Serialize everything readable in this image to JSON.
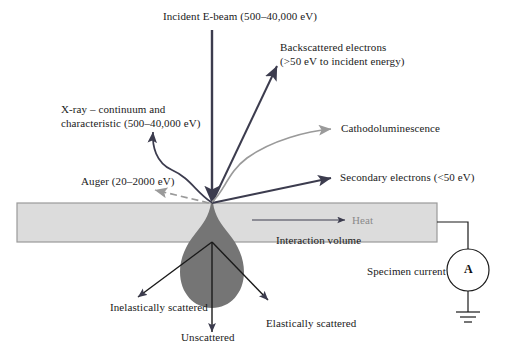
{
  "figure": {
    "title_semantics": "electron-beam specimen interaction diagram",
    "colors": {
      "slab_fill": "#dcdcdc",
      "slab_stroke": "#9a9a9a",
      "interaction_volume_fill": "#757575",
      "arrow_dark": "#3c3c4e",
      "arrow_gray": "#9a9a9a",
      "text": "#1a1a1a",
      "text_gray": "#8a8a8a",
      "background": "#ffffff"
    }
  },
  "labels": {
    "incident_beam": "Incident E-beam (500–40,000 eV)",
    "backscattered_line1": "Backscattered electrons",
    "backscattered_line2": "(>50 eV to incident energy)",
    "xray_line1": "X-ray – continuum and",
    "xray_line2": "characteristic (500–40,000 eV)",
    "cathodoluminescence": "Cathodoluminescence",
    "auger": "Auger (20–2000 eV)",
    "secondary_electrons": "Secondary electrons (<50 eV)",
    "heat": "Heat",
    "interaction_volume": "Interaction volume",
    "inelastically_scattered": "Inelastically scattered",
    "unscattered": "Unscattered",
    "elastically_scattered": "Elastically scattered",
    "specimen_current": "Specimen current",
    "ammeter": "A"
  }
}
